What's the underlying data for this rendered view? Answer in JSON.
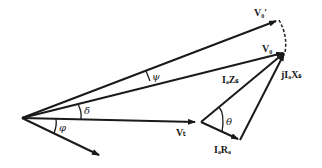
{
  "diagram": {
    "type": "phasor-diagram",
    "colors": {
      "ink": "#1a1a1a",
      "background": "#ffffff"
    },
    "labels": {
      "v0_prime": "V₀′",
      "v0": "V₀",
      "vt": "Vₜ",
      "ia_zs": "IₐZₛ",
      "j_ia_xs": "jIₐXₛ",
      "ia_ra": "IₐRₐ",
      "psi": "ψ",
      "delta": "δ",
      "phi": "φ",
      "theta": "θ"
    },
    "vectors": [
      {
        "name": "V0'",
        "from": [
          22,
          118
        ],
        "to": [
          278,
          20
        ]
      },
      {
        "name": "V0",
        "from": [
          22,
          118
        ],
        "to": [
          285,
          52
        ]
      },
      {
        "name": "Vt",
        "from": [
          22,
          118
        ],
        "to": [
          195,
          122
        ]
      },
      {
        "name": "Ia",
        "from": [
          22,
          118
        ],
        "to": [
          100,
          156
        ]
      },
      {
        "name": "IaRa",
        "from": [
          200,
          122
        ],
        "to": [
          240,
          140
        ]
      },
      {
        "name": "IaZs",
        "from": [
          200,
          122
        ],
        "to": [
          285,
          52
        ]
      },
      {
        "name": "jIaXs",
        "from": [
          240,
          140
        ],
        "to": [
          285,
          52
        ]
      }
    ]
  }
}
